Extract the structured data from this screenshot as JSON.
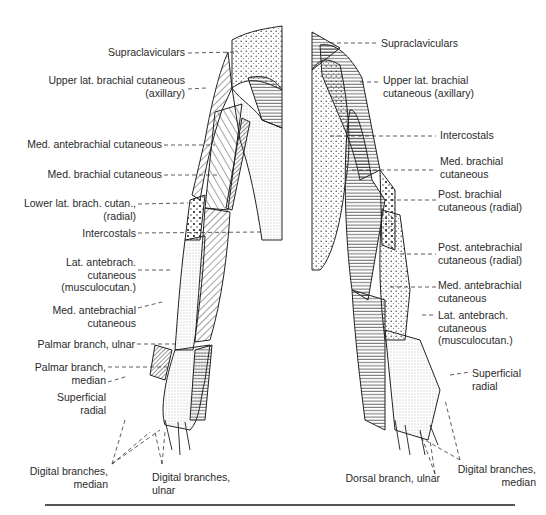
{
  "figure": {
    "type": "dermatome-map",
    "views": [
      "anterior",
      "posterior"
    ],
    "left_view": {
      "labels": [
        {
          "id": "supraclaviculars",
          "text": "Supraclaviculars"
        },
        {
          "id": "upper-lat-brachial",
          "lines": [
            "Upper lat. brachial cutaneous",
            "(axillary)"
          ]
        },
        {
          "id": "med-antebrachial-1",
          "text": "Med. antebrachial cutaneous"
        },
        {
          "id": "med-brachial",
          "text": "Med. brachial cutaneous"
        },
        {
          "id": "lower-lat-brach",
          "lines": [
            "Lower lat. brach. cutan.,",
            "(radial)"
          ]
        },
        {
          "id": "intercostals",
          "text": "Intercostals"
        },
        {
          "id": "lat-antebrach",
          "lines": [
            "Lat. antebrach.",
            "cutaneous",
            "(musculocutan.)"
          ]
        },
        {
          "id": "med-antebrachial-2",
          "lines": [
            "Med. antebrachial",
            "cutaneous"
          ]
        },
        {
          "id": "palmar-ulnar",
          "text": "Palmar branch, ulnar"
        },
        {
          "id": "palmar-median",
          "lines": [
            "Palmar branch,",
            "median"
          ]
        },
        {
          "id": "superficial-radial",
          "lines": [
            "Superficial",
            "radial"
          ]
        },
        {
          "id": "digital-median",
          "lines": [
            "Digital branches,",
            "median"
          ]
        },
        {
          "id": "digital-ulnar",
          "lines": [
            "Digital branches,",
            "ulnar"
          ]
        }
      ]
    },
    "right_view": {
      "labels": [
        {
          "id": "supraclaviculars",
          "text": "Supraclaviculars"
        },
        {
          "id": "upper-lat-brachial",
          "lines": [
            "Upper lat. brachial",
            "cutaneous (axillary)"
          ]
        },
        {
          "id": "intercostals",
          "text": "Intercostals"
        },
        {
          "id": "med-brachial",
          "lines": [
            "Med. brachial",
            "cutaneous"
          ]
        },
        {
          "id": "post-brachial",
          "lines": [
            "Post. brachial",
            "cutaneous (radial)"
          ]
        },
        {
          "id": "post-antebrachial",
          "lines": [
            "Post. antebrachial",
            "cutaneous (radial)"
          ]
        },
        {
          "id": "med-antebrachial",
          "lines": [
            "Med. antebrachial",
            "cutaneous"
          ]
        },
        {
          "id": "lat-antebrach",
          "lines": [
            "Lat. antebrach.",
            "cutaneous",
            "(musculocutan.)"
          ]
        },
        {
          "id": "superficial-radial",
          "lines": [
            "Superficial",
            "radial"
          ]
        },
        {
          "id": "dorsal-ulnar",
          "text": "Dorsal branch, ulnar"
        },
        {
          "id": "digital-median",
          "lines": [
            "Digital branches,",
            "median"
          ]
        }
      ]
    }
  },
  "L": {
    "supra": "Supraclaviculars",
    "upper1": "Upper lat. brachial cutaneous",
    "upper2": "(axillary)",
    "medante": "Med. antebrachial cutaneous",
    "medbrach": "Med. brachial cutaneous",
    "lower1": "Lower lat. brach. cutan.,",
    "lower2": "(radial)",
    "interc": "Intercostals",
    "lat1": "Lat. antebrach.",
    "lat2": "cutaneous",
    "lat3": "(musculocutan.)",
    "medante2a": "Med. antebrachial",
    "medante2b": "cutaneous",
    "palmu": "Palmar branch, ulnar",
    "palmm1": "Palmar branch,",
    "palmm2": "median",
    "sup1": "Superficial",
    "sup2": "radial",
    "digm1": "Digital branches,",
    "digm2": "median",
    "digu1": "Digital branches,",
    "digu2": "ulnar"
  },
  "R": {
    "supra": "Supraclaviculars",
    "upper1": "Upper lat. brachial",
    "upper2": "cutaneous (axillary)",
    "interc": "Intercostals",
    "medbrach1": "Med. brachial",
    "medbrach2": "cutaneous",
    "post1": "Post. brachial",
    "post2": "cutaneous (radial)",
    "postante1": "Post. antebrachial",
    "postante2": "cutaneous (radial)",
    "medante1": "Med. antebrachial",
    "medante2": "cutaneous",
    "lat1": "Lat. antebrach.",
    "lat2": "cutaneous",
    "lat3": "(musculocutan.)",
    "sup1": "Superficial",
    "sup2": "radial",
    "dorsal": "Dorsal branch, ulnar",
    "digm1": "Digital branches,",
    "digm2": "median"
  }
}
